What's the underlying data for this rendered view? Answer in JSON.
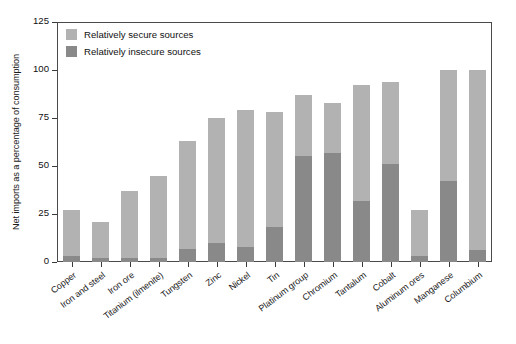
{
  "chart_data": {
    "type": "bar",
    "title": "",
    "xlabel": "",
    "ylabel": "Net imports as a percentage of consumption",
    "ylim": [
      0,
      125
    ],
    "yticks": [
      0,
      25,
      50,
      75,
      100,
      125
    ],
    "grid": false,
    "stacked": true,
    "legend_position": "top-left",
    "categories": [
      "Copper",
      "Iron and steel",
      "Iron ore",
      "Titanium (ilmenite)",
      "Tungsten",
      "Zinc",
      "Nickel",
      "Tin",
      "Platinum group",
      "Chromium",
      "Tantalum",
      "Cobalt",
      "Aluminum ores",
      "Manganese",
      "Columbium"
    ],
    "series": [
      {
        "name": "Relatively insecure sources",
        "color": "#898989",
        "values": [
          3,
          2,
          2,
          2,
          7,
          10,
          8,
          18,
          55,
          57,
          32,
          51,
          3,
          42,
          6
        ]
      },
      {
        "name": "Relatively secure sources",
        "color": "#b2b2b2",
        "values": [
          24,
          19,
          35,
          43,
          56,
          65,
          71,
          60,
          32,
          26,
          60,
          43,
          24,
          58,
          94
        ]
      }
    ],
    "totals": [
      27,
      21,
      37,
      45,
      63,
      75,
      79,
      78,
      87,
      83,
      92,
      94,
      27,
      100,
      100
    ]
  },
  "legend": {
    "items": [
      {
        "label": "Relatively secure sources",
        "color": "#b2b2b2"
      },
      {
        "label": "Relatively insecure sources",
        "color": "#898989"
      }
    ]
  }
}
